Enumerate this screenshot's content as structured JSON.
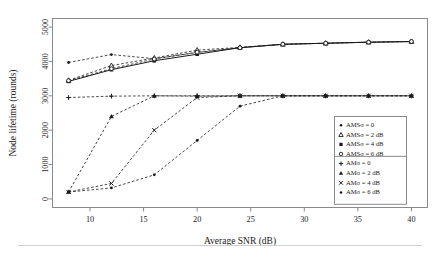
{
  "chart_data": {
    "type": "line",
    "title": "",
    "xlabel": "Average SNR (dB)",
    "ylabel": "Node lifetime (rounds)",
    "xlim": [
      6.5,
      41.5
    ],
    "ylim": [
      -250,
      5250
    ],
    "xticks": [
      10,
      15,
      20,
      25,
      30,
      35,
      40
    ],
    "yticks": [
      0,
      1000,
      2000,
      3000,
      4000,
      5000
    ],
    "grid": false,
    "legend_position": "right-bottom",
    "x": [
      8,
      12,
      16,
      20,
      24,
      28,
      32,
      36,
      40
    ],
    "series": [
      {
        "name": "AMSσ = 0",
        "marker": "dot",
        "line": "dashed",
        "values": [
          3970,
          4200,
          4080,
          4260,
          4400,
          4500,
          4530,
          4560,
          4580
        ]
      },
      {
        "name": "AMSσ = 2 dB",
        "marker": "triangle-open",
        "line": "dashed",
        "values": [
          3450,
          3880,
          4100,
          4330,
          4410,
          4500,
          4530,
          4560,
          4580
        ]
      },
      {
        "name": "AMSσ = 4 dB",
        "marker": "square-filled",
        "line": "solid",
        "values": [
          3420,
          3760,
          4020,
          4210,
          4400,
          4500,
          4530,
          4560,
          4580
        ]
      },
      {
        "name": "AMSσ = 6 dB",
        "marker": "circle-open",
        "line": "dashed",
        "values": [
          3440,
          3790,
          4070,
          4270,
          4400,
          4500,
          4530,
          4560,
          4580
        ]
      },
      {
        "name": "AMσ = 0",
        "marker": "plus",
        "line": "dashed",
        "values": [
          2950,
          2990,
          3000,
          3000,
          3000,
          3000,
          3000,
          3000,
          3000
        ]
      },
      {
        "name": "AMσ = 2 dB",
        "marker": "triangle-filled",
        "line": "dashed",
        "values": [
          200,
          2400,
          3000,
          2990,
          3000,
          3000,
          3000,
          3000,
          3000
        ]
      },
      {
        "name": "AMσ = 4 dB",
        "marker": "cross",
        "line": "dashed",
        "values": [
          200,
          450,
          2000,
          2950,
          3000,
          3000,
          3000,
          3000,
          3000
        ]
      },
      {
        "name": "AMσ = 6 dB",
        "marker": "dot",
        "line": "dashed",
        "values": [
          200,
          320,
          700,
          1700,
          2700,
          3000,
          3000,
          3000,
          3000
        ]
      }
    ]
  },
  "legend": {
    "groups": [
      {
        "entries": [
          {
            "marker": "dot",
            "label": "AMSσ = 0"
          },
          {
            "marker": "triangle-open",
            "label": "AMSσ = 2 dB"
          },
          {
            "marker": "square-filled",
            "label": "AMSσ = 4 dB"
          },
          {
            "marker": "circle-open",
            "label": "AMSσ = 6 dB"
          }
        ]
      },
      {
        "entries": [
          {
            "marker": "plus",
            "label": "AMσ = 0"
          },
          {
            "marker": "triangle-filled",
            "label": "AMσ = 2 dB"
          },
          {
            "marker": "cross",
            "label": "AMσ = 4 dB"
          },
          {
            "marker": "dot",
            "label": "AMσ = 6 dB"
          }
        ]
      }
    ]
  },
  "colors": {
    "ink": "#1a1a1a",
    "frame": "#8a8a8a",
    "background": "#ffffff",
    "rule": "#cfcfcf"
  }
}
